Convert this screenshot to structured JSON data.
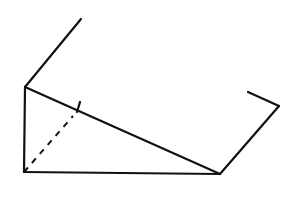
{
  "diagram": {
    "type": "geometric-line-drawing",
    "stroke_color": "#111111",
    "background": "#ffffff",
    "lines": {
      "upper_extension": [
        [
          25,
          87
        ],
        [
          81,
          19
        ]
      ],
      "left_vertical": [
        [
          25,
          87
        ],
        [
          24,
          172
        ]
      ],
      "hypotenuse": [
        [
          25,
          87
        ],
        [
          220,
          174
        ]
      ],
      "base": [
        [
          24,
          172
        ],
        [
          220,
          174
        ]
      ],
      "right_rising": [
        [
          220,
          174
        ],
        [
          279,
          106
        ]
      ],
      "right_hook": [
        [
          279,
          106
        ],
        [
          248,
          92
        ]
      ],
      "tick_mark": [
        [
          80,
          102
        ],
        [
          77,
          112
        ]
      ]
    },
    "dashed_lines": {
      "altitude": [
        [
          24,
          172
        ],
        [
          73,
          116
        ]
      ]
    }
  }
}
